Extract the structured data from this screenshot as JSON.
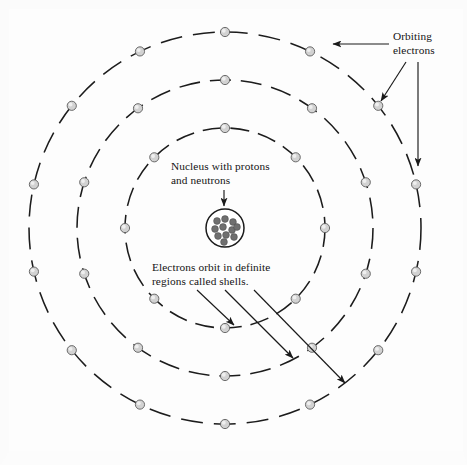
{
  "figure": {
    "background_color": "#fdfdfd",
    "line_color": "#1c1c1c"
  },
  "labels": {
    "orbiting_electrons": "Orbiting\nelectrons",
    "nucleus": "Nucleus with protons\nand neutrons",
    "shells": "Electrons orbit in definite\nregions called shells."
  },
  "caption": "",
  "chart_data": {
    "type": "diagram",
    "center": {
      "x": 225,
      "y": 228
    },
    "nucleus": {
      "radius": 19,
      "nucleon_count": 11,
      "nucleon_radius": 3.4,
      "fill": "#ffffff",
      "stroke": "#1b1b1b",
      "nucleon_color": "#6f6f6f",
      "nucleons": [
        {
          "x": -8,
          "y": -7
        },
        {
          "x": 0,
          "y": -9
        },
        {
          "x": 8,
          "y": -6
        },
        {
          "x": -10,
          "y": 1
        },
        {
          "x": -2,
          "y": -1
        },
        {
          "x": 7,
          "y": 2
        },
        {
          "x": -7,
          "y": 8
        },
        {
          "x": 1,
          "y": 7
        },
        {
          "x": 9,
          "y": 9
        },
        {
          "x": -1,
          "y": 14
        },
        {
          "x": 12,
          "y": -1
        }
      ]
    },
    "shells": [
      {
        "name": "inner-shell",
        "radius": 100,
        "electron_count": 8,
        "start_angle": -90,
        "dash": "19 9"
      },
      {
        "name": "middle-shell",
        "radius": 148,
        "electron_count": 10,
        "start_angle": -90,
        "dash": "21 10"
      },
      {
        "name": "outer-shell",
        "radius": 196,
        "electron_count": 14,
        "start_angle": -90,
        "dash": "22 11"
      }
    ],
    "electron": {
      "radius": 4.6,
      "fill": "#d2d2d2",
      "stroke": "#5e5e5e"
    },
    "annotations": [
      {
        "name": "orbiting-electrons",
        "text": "Orbiting electrons",
        "arrow_count": 2
      },
      {
        "name": "nucleus",
        "text": "Nucleus with protons and neutrons",
        "arrow_count": 1
      },
      {
        "name": "shells",
        "text": "Electrons orbit in definite regions called shells.",
        "arrow_count": 3
      }
    ]
  }
}
